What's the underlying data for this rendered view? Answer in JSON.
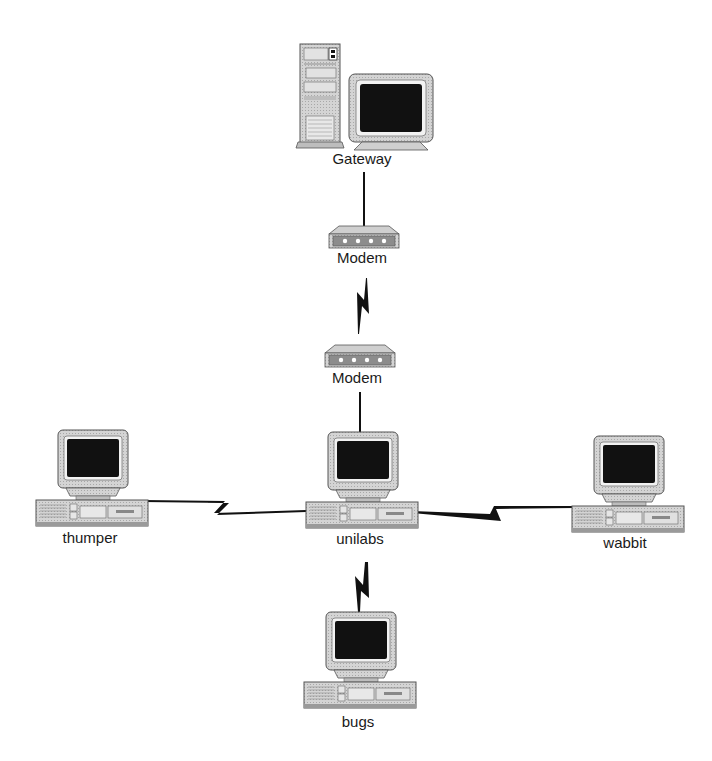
{
  "diagram": {
    "title": "",
    "nodes": [
      {
        "id": "gateway",
        "label": "Gateway",
        "type": "tower-workstation",
        "x": 362,
        "y": 158
      },
      {
        "id": "modem1",
        "label": "Modem",
        "type": "modem",
        "x": 362,
        "y": 256
      },
      {
        "id": "modem2",
        "label": "Modem",
        "type": "modem",
        "x": 356,
        "y": 378
      },
      {
        "id": "thumper",
        "label": "thumper",
        "type": "desktop-pc",
        "x": 90,
        "y": 538
      },
      {
        "id": "unilabs",
        "label": "unilabs",
        "type": "desktop-pc",
        "x": 360,
        "y": 538
      },
      {
        "id": "wabbit",
        "label": "wabbit",
        "type": "desktop-pc",
        "x": 623,
        "y": 542
      },
      {
        "id": "bugs",
        "label": "bugs",
        "type": "desktop-pc",
        "x": 358,
        "y": 722
      }
    ],
    "links": [
      {
        "from": "gateway",
        "to": "modem1",
        "style": "line"
      },
      {
        "from": "modem1",
        "to": "modem2",
        "style": "lightning"
      },
      {
        "from": "modem2",
        "to": "unilabs",
        "style": "line"
      },
      {
        "from": "thumper",
        "to": "unilabs",
        "style": "lightning"
      },
      {
        "from": "unilabs",
        "to": "wabbit",
        "style": "lightning"
      },
      {
        "from": "unilabs",
        "to": "bugs",
        "style": "lightning"
      }
    ]
  },
  "colors": {
    "screen": "#111111",
    "case": "#cfcfcf",
    "case_dark": "#9a9a9a",
    "line": "#111111"
  }
}
